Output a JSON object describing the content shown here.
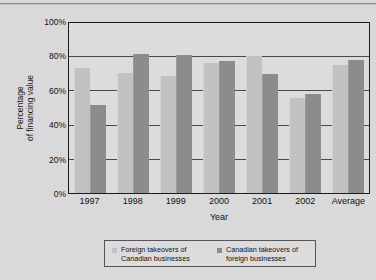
{
  "chart_data": {
    "type": "bar",
    "title": "",
    "subtitle": "",
    "xlabel": "Year",
    "ylabel": "Percentage of financing value",
    "ylabel_line1": "Percentage",
    "ylabel_line2": "of financing value",
    "categories": [
      "1997",
      "1998",
      "1999",
      "2000",
      "2001",
      "2002",
      "Average"
    ],
    "series": [
      {
        "name": "Foreign takeovers of Canadian businesses",
        "name_line1": "Foreign takeovers of",
        "name_line2": "Canadian businesses",
        "color": "#c2c2c2",
        "values": [
          74,
          71,
          69,
          77,
          81,
          56,
          76
        ]
      },
      {
        "name": "Canadian takeovers of foreign businesses",
        "name_line1": "Canadian takeovers of",
        "name_line2": "foreign businesses",
        "color": "#8c8c8c",
        "values": [
          52,
          82.5,
          81.5,
          78,
          70.5,
          58.5,
          78.5
        ]
      }
    ],
    "ylim": [
      0,
      100
    ],
    "yticks": [
      "0%",
      "20%",
      "40%",
      "60%",
      "80%",
      "100%"
    ],
    "ytick_values": [
      0,
      20,
      40,
      60,
      80,
      100
    ],
    "grid": true,
    "legend_position": "bottom"
  }
}
